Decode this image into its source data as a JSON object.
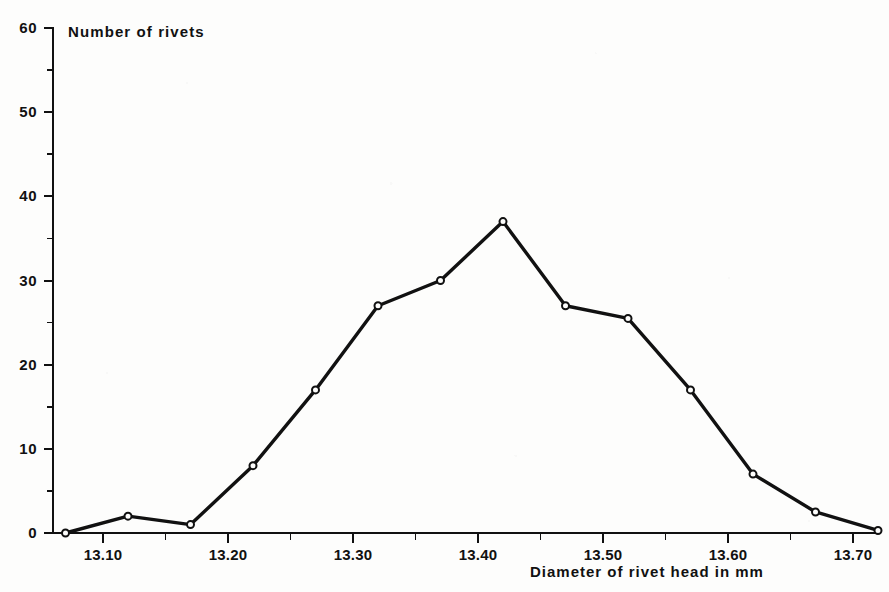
{
  "chart_data": {
    "type": "line",
    "title": "Number of rivets",
    "subtitle": "",
    "xlabel": "Diameter of rivet head in mm",
    "ylabel": "Number of rivets",
    "xlim": [
      13.065,
      13.725
    ],
    "ylim": [
      0,
      60
    ],
    "grid": false,
    "legend": null,
    "marker": "open-circle",
    "line_color": "#111111",
    "x": [
      13.07,
      13.12,
      13.17,
      13.22,
      13.27,
      13.32,
      13.37,
      13.42,
      13.47,
      13.52,
      13.57,
      13.62,
      13.67,
      13.72
    ],
    "values": [
      0,
      2,
      1,
      8,
      17,
      27,
      30,
      37,
      27,
      25.5,
      17,
      7,
      2.5,
      0.3
    ],
    "x_tick_values": [
      13.1,
      13.2,
      13.3,
      13.4,
      13.5,
      13.6,
      13.7
    ],
    "x_tick_labels": [
      "13.10",
      "13.20",
      "13.30",
      "13.40",
      "13.50",
      "13.60",
      "13.70"
    ],
    "x_minor_tick_values": [
      13.15,
      13.25,
      13.35,
      13.45,
      13.55,
      13.65
    ],
    "y_tick_values": [
      0,
      10,
      20,
      30,
      40,
      50,
      60
    ],
    "y_tick_labels": [
      "0",
      "10",
      "20",
      "30",
      "40",
      "50",
      "60"
    ],
    "y_minor_tick_values": [
      5,
      15,
      25,
      35,
      45,
      55
    ],
    "annotations": []
  },
  "figure": {
    "background_color": "#fdfdfc",
    "axis_color": "#111111",
    "text_color": "#111111"
  }
}
